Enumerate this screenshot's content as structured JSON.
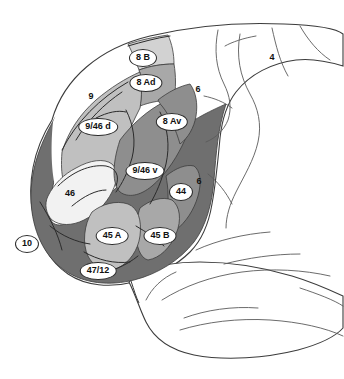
{
  "figure": {
    "background_color": "#ffffff",
    "outline_color": "#3c3c3c"
  },
  "palette": {
    "white": "#ffffff",
    "very_light_gray": "#f2f2f2",
    "light_gray": "#d2d2d2",
    "light_medium_gray": "#c0c0c0",
    "medium_gray": "#a8a8a8",
    "medium_dark_gray": "#8e8e8e",
    "dark_gray": "#6f6f6f",
    "outline": "#3c3c3c",
    "sulcus_line": "#2b2b2b",
    "label_text": "#111111",
    "label_fill": "#ffffff"
  },
  "regions": [
    {
      "id": "area-10",
      "label": "10",
      "fill": "#6f6f6f",
      "style": "pill",
      "x": 27,
      "y": 244
    },
    {
      "id": "area-47-12",
      "label": "47/12",
      "fill": "#6f6f6f",
      "style": "pill",
      "x": 98,
      "y": 271
    },
    {
      "id": "area-46",
      "label": "46",
      "fill": "#f2f2f2",
      "style": "plain",
      "x": 70,
      "y": 193
    },
    {
      "id": "area-45a",
      "label": "45 A",
      "fill": "#c0c0c0",
      "style": "pill",
      "x": 112,
      "y": 236
    },
    {
      "id": "area-45b",
      "label": "45 B",
      "fill": "#a8a8a8",
      "style": "pill",
      "x": 160,
      "y": 236
    },
    {
      "id": "area-44",
      "label": "44",
      "fill": "#8e8e8e",
      "style": "pill",
      "x": 181,
      "y": 192
    },
    {
      "id": "area-9-46d",
      "label": "9/46 d",
      "fill": "#c0c0c0",
      "style": "pill",
      "x": 98,
      "y": 127
    },
    {
      "id": "area-9-46v",
      "label": "9/46 v",
      "fill": "#8e8e8e",
      "style": "pill",
      "x": 145,
      "y": 171
    },
    {
      "id": "area-9",
      "label": "9",
      "fill": "#ffffff",
      "style": "plain",
      "x": 91,
      "y": 96
    },
    {
      "id": "area-8ad",
      "label": "8 Ad",
      "fill": "#a8a8a8",
      "style": "pill",
      "x": 146,
      "y": 83
    },
    {
      "id": "area-8b",
      "label": "8 B",
      "fill": "#d2d2d2",
      "style": "pill",
      "x": 143,
      "y": 58
    },
    {
      "id": "area-8av",
      "label": "8 Av",
      "fill": "#8e8e8e",
      "style": "pill",
      "x": 172,
      "y": 122
    },
    {
      "id": "area-6-dorsal",
      "label": "6",
      "fill": "#ffffff",
      "style": "plain",
      "x": 198,
      "y": 89
    },
    {
      "id": "area-6-ventral",
      "label": "6",
      "fill": "#ffffff",
      "style": "plain",
      "x": 199,
      "y": 181
    },
    {
      "id": "area-4",
      "label": "4",
      "fill": "#ffffff",
      "style": "plain",
      "x": 272,
      "y": 57
    }
  ]
}
